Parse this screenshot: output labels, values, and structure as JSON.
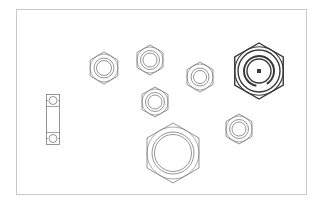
{
  "drawing": {
    "background": "#ffffff",
    "frame": {
      "x": 16,
      "y": 9,
      "w": 290,
      "h": 185,
      "stroke": "#c8c8c8"
    },
    "line_color": "#7a7a7a",
    "bold_line_color": "#3a3a3a",
    "nuts": [
      {
        "id": "nut-a",
        "cx": 104,
        "cy": 68,
        "r": 16,
        "inner_r": [
          10,
          7.5
        ],
        "style": "thin"
      },
      {
        "id": "nut-b",
        "cx": 150,
        "cy": 60,
        "r": 15,
        "inner_r": [
          9.5,
          7
        ],
        "style": "thin"
      },
      {
        "id": "nut-c",
        "cx": 155,
        "cy": 102,
        "r": 15,
        "inner_r": [
          9.5,
          7
        ],
        "style": "thin"
      },
      {
        "id": "nut-d",
        "cx": 200,
        "cy": 77,
        "r": 15,
        "inner_r": [
          9,
          6.5
        ],
        "style": "thin"
      },
      {
        "id": "nut-e",
        "cx": 259,
        "cy": 71,
        "r": 28,
        "inner_r": [
          21,
          15,
          12
        ],
        "style": "bold",
        "center_square": 4
      },
      {
        "id": "nut-f",
        "cx": 173,
        "cy": 153,
        "r": 30,
        "inner_r": [
          21,
          18.5
        ],
        "style": "thin"
      },
      {
        "id": "nut-g",
        "cx": 239,
        "cy": 129,
        "r": 15,
        "inner_r": [
          9.5,
          7
        ],
        "style": "thin"
      }
    ],
    "bearing": {
      "id": "bearing-side-view",
      "x": 46,
      "y": 94,
      "w": 13,
      "h": 50,
      "ball_r": 4
    }
  }
}
